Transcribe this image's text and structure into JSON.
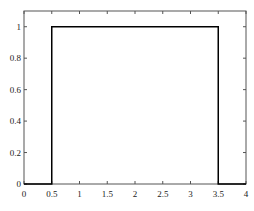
{
  "chart_data": {
    "type": "line",
    "title": "",
    "xlabel": "",
    "ylabel": "",
    "xlim": [
      0,
      4
    ],
    "ylim": [
      0,
      1.1
    ],
    "grid": false,
    "legend": null,
    "x_ticks": [
      0,
      0.5,
      1,
      1.5,
      2,
      2.5,
      3,
      3.5,
      4
    ],
    "x_tick_labels": [
      "0",
      "0.5",
      "1",
      "1.5",
      "2",
      "2.5",
      "3",
      "3.5",
      "4"
    ],
    "y_ticks": [
      0,
      0.2,
      0.4,
      0.6,
      0.8,
      1
    ],
    "y_tick_labels": [
      "0",
      "0.2",
      "0.4",
      "0.6",
      "0.8",
      "1"
    ],
    "series": [
      {
        "name": "rectangular pulse",
        "color": "#000000",
        "x": [
          0,
          0.5,
          0.5,
          3.5,
          3.5,
          4
        ],
        "y": [
          0,
          0,
          1,
          1,
          0,
          0
        ]
      }
    ]
  },
  "colors": {
    "axes": "#555555",
    "line": "#000000",
    "text": "#222222",
    "background": "#ffffff"
  }
}
